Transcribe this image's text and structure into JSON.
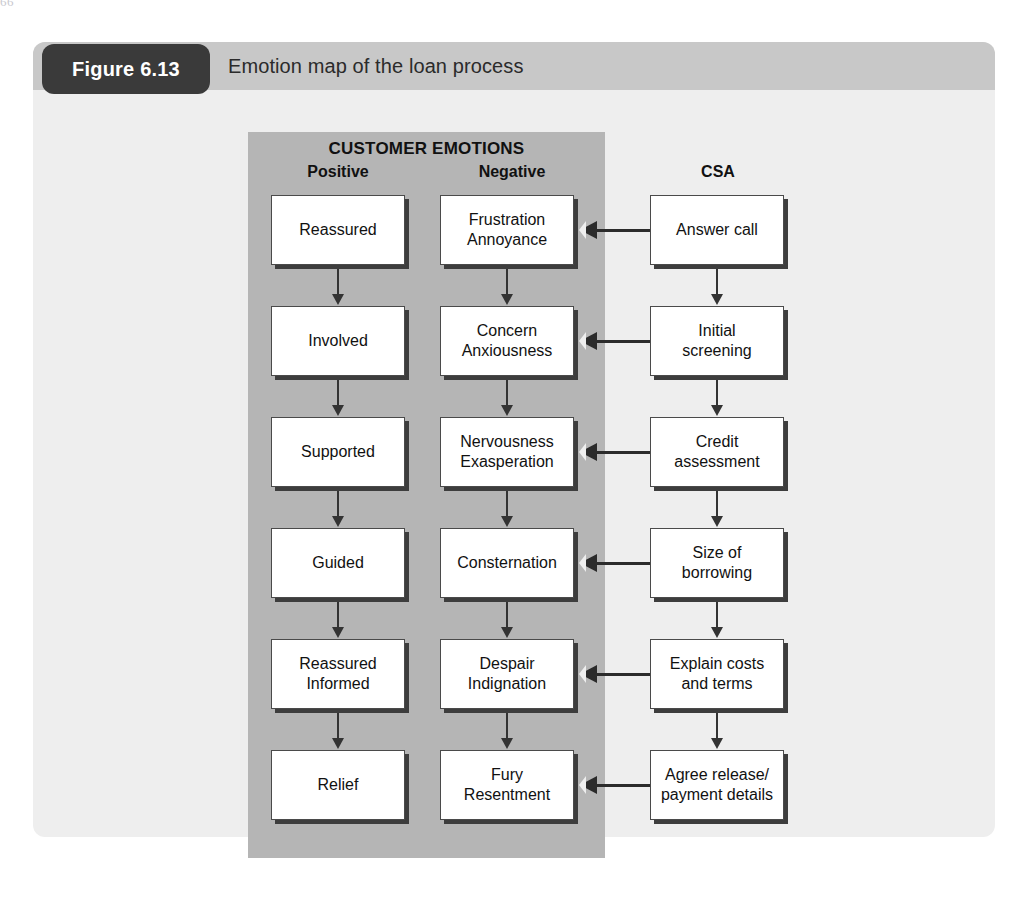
{
  "page_edge_text": "66",
  "figure": {
    "badge_label": "Figure 6.13",
    "title": "Emotion map of the loan process"
  },
  "headings": {
    "customer_emotions": "CUSTOMER EMOTIONS",
    "positive": "Positive",
    "negative": "Negative",
    "csa": "CSA"
  },
  "colors": {
    "band_gray": "#b5b5b5",
    "panel_gray": "#eeeeee",
    "header_gray": "#c8c8c8",
    "badge_dark": "#3a3a3a",
    "box_white": "#ffffff",
    "stroke_dark": "#3d3d3d"
  },
  "chart_data": {
    "type": "diagram",
    "title": "Emotion map of the loan process",
    "columns": [
      "Positive",
      "Negative",
      "CSA"
    ],
    "column_group": "CUSTOMER EMOTIONS",
    "flow_direction": "CSA step -> Negative emotion; columns flow top to bottom",
    "rows": [
      {
        "positive": [
          "Reassured"
        ],
        "negative": [
          "Frustration",
          "Annoyance"
        ],
        "csa": [
          "Answer call"
        ]
      },
      {
        "positive": [
          "Involved"
        ],
        "negative": [
          "Concern",
          "Anxiousness"
        ],
        "csa": [
          "Initial",
          "screening"
        ]
      },
      {
        "positive": [
          "Supported"
        ],
        "negative": [
          "Nervousness",
          "Exasperation"
        ],
        "csa": [
          "Credit",
          "assessment"
        ]
      },
      {
        "positive": [
          "Guided"
        ],
        "negative": [
          "Consternation"
        ],
        "csa": [
          "Size of",
          "borrowing"
        ]
      },
      {
        "positive": [
          "Reassured",
          "Informed"
        ],
        "negative": [
          "Despair",
          "Indignation"
        ],
        "csa": [
          "Explain costs",
          "and terms"
        ]
      },
      {
        "positive": [
          "Relief"
        ],
        "negative": [
          "Fury",
          "Resentment"
        ],
        "csa": [
          "Agree release/",
          "payment details"
        ]
      }
    ]
  }
}
